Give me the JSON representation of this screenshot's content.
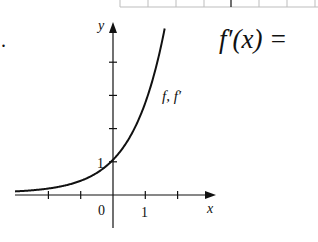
{
  "chart_data": {
    "type": "line",
    "title": "",
    "xlabel": "x",
    "ylabel": "y",
    "xlim": [
      -3.1,
      3.1
    ],
    "ylim": [
      -1,
      5.2
    ],
    "x_ticks": [
      -2,
      -1,
      0,
      1,
      2
    ],
    "y_ticks": [
      1,
      2,
      3,
      4
    ],
    "tick_labels": {
      "x_zero": "0",
      "x_one": "1",
      "y_one": "1"
    },
    "grid": false,
    "series": [
      {
        "name": "f, f′",
        "function": "e^x",
        "x": [
          -3,
          -2.5,
          -2,
          -1.5,
          -1,
          -0.5,
          0,
          0.25,
          0.5,
          0.75,
          1,
          1.25,
          1.5,
          1.6
        ],
        "y": [
          0.05,
          0.08,
          0.14,
          0.22,
          0.37,
          0.61,
          1,
          1.28,
          1.65,
          2.12,
          2.72,
          3.49,
          4.48,
          4.95
        ]
      }
    ],
    "annotations": [
      {
        "text": "f, f′",
        "near": "curve upper-right"
      }
    ]
  },
  "side_text": {
    "formula": "f′(x) = "
  },
  "margin_mark": "."
}
